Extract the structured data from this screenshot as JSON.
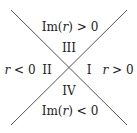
{
  "diagram": {
    "lines": [
      {
        "x1": 11,
        "y1": 10,
        "x2": 127,
        "y2": 125
      },
      {
        "x1": 127,
        "y1": 10,
        "x2": 11,
        "y2": 125
      }
    ],
    "line_color": "#555555",
    "regions": {
      "top_condition": {
        "prefix": "Im(",
        "var": "r",
        "suffix": ") > 0"
      },
      "top_region": "III",
      "left_condition": {
        "var": "r",
        "suffix": " < 0"
      },
      "left_region": "II",
      "right_region": "I",
      "right_condition": {
        "var": "r",
        "suffix": " > 0"
      },
      "bottom_region": "IV",
      "bottom_condition": {
        "prefix": "Im(",
        "var": "r",
        "suffix": ") < 0"
      }
    }
  }
}
